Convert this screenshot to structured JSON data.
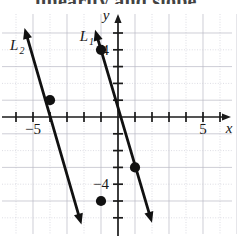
{
  "page": {
    "clipped_heading": "linearity and slope.",
    "background": "#ffffff",
    "ink_color": "#111111",
    "grid_color": "#b9b9c4"
  },
  "chart_data": {
    "type": "line",
    "title": "",
    "xlabel": "x",
    "ylabel": "y",
    "xlim": [
      -7,
      7
    ],
    "ylim": [
      -6.9,
      5.8
    ],
    "grid": true,
    "legend": "inline-labels",
    "x_ticks": [
      -6,
      -5,
      -4,
      -3,
      -2,
      -1,
      1,
      2,
      3,
      4,
      5,
      6
    ],
    "y_ticks": [
      -6,
      -5,
      -4,
      -3,
      -2,
      -1,
      1,
      2,
      3,
      4,
      5
    ],
    "x_tick_labels": [
      {
        "value": -5,
        "text": "−5"
      },
      {
        "value": 5,
        "text": "5"
      }
    ],
    "y_tick_labels": [
      {
        "value": 4,
        "text": "4"
      },
      {
        "value": -4,
        "text": "−4"
      }
    ],
    "axis_labels": {
      "x": "x",
      "y": "y"
    },
    "series": [
      {
        "name": "L₁",
        "label_text": "L",
        "label_subscript": "1",
        "slope": -3.5,
        "intercept": 0.5,
        "points": [
          {
            "x": -1,
            "y": 4
          },
          {
            "x": 1,
            "y": -3
          }
        ],
        "arrow_start": {
          "x": -1.35,
          "y": 5.2
        },
        "arrow_end": {
          "x": 2.0,
          "y": -6.3
        },
        "label_pos": {
          "x": -2.25,
          "y": 4.55
        }
      },
      {
        "name": "L₂",
        "label_text": "L",
        "label_subscript": "2",
        "slope": -3.5,
        "intercept": -12.5,
        "points": [
          {
            "x": -4,
            "y": 1
          },
          {
            "x": -1,
            "y": -5
          }
        ],
        "arrow_start": {
          "x": -5.5,
          "y": 5.3
        },
        "arrow_end": {
          "x": -2.15,
          "y": -6.4
        },
        "label_pos": {
          "x": -6.35,
          "y": 4.0
        }
      }
    ]
  }
}
